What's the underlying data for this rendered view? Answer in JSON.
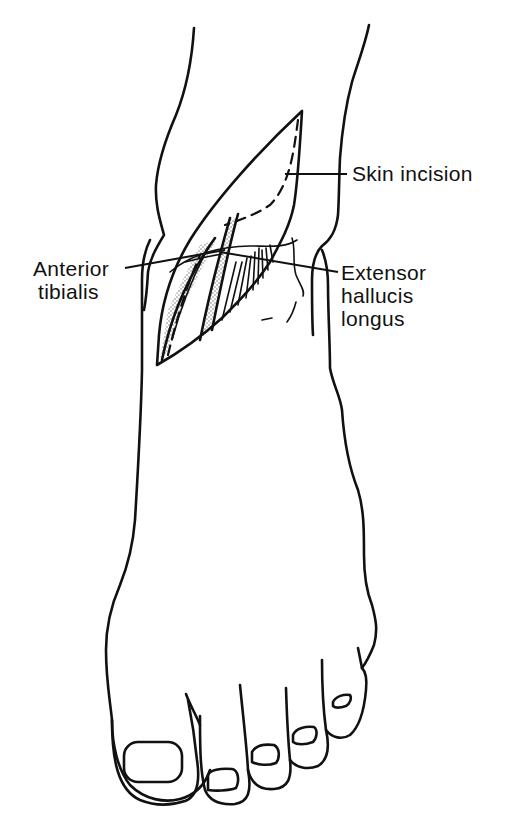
{
  "figure": {
    "labels": {
      "skin_incision": "Skin incision",
      "anterior_tibialis_line1": "Anterior",
      "anterior_tibialis_line2": "tibialis",
      "ehl_line1": "Extensor",
      "ehl_line2": "hallucis",
      "ehl_line3": "longus"
    },
    "colors": {
      "ink": "#111111",
      "background": "#ffffff",
      "stipple": "#9a9a9a"
    }
  }
}
